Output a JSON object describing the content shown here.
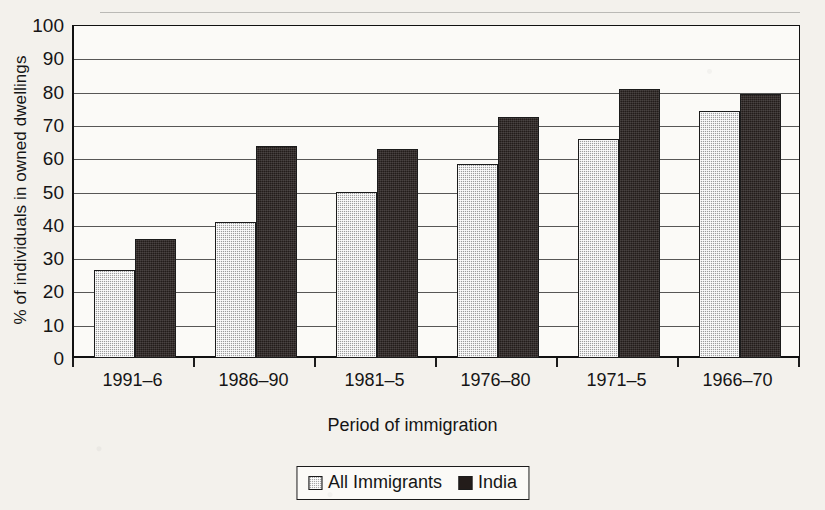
{
  "chart_data": {
    "type": "bar",
    "title": "",
    "xlabel": "Period of immigration",
    "ylabel": "% of individuals in owned dwellings",
    "categories": [
      "1991–6",
      "1986–90",
      "1981–5",
      "1976–80",
      "1971–5",
      "1966–70"
    ],
    "series": [
      {
        "name": "All Immigrants",
        "values": [
          26.5,
          41,
          50,
          58.5,
          66,
          74.5
        ],
        "color": "#9c9c9c",
        "pattern": "light-hatch"
      },
      {
        "name": "India",
        "values": [
          36,
          64,
          63,
          72.5,
          81,
          79.5
        ],
        "color": "#231c1a",
        "pattern": "solid-dark"
      }
    ],
    "ylim": [
      0,
      100
    ],
    "ytick_labels": [
      "100",
      "90",
      "80",
      "70",
      "60",
      "50",
      "40",
      "30",
      "20",
      "10",
      "0"
    ],
    "ytick_values": [
      100,
      90,
      80,
      70,
      60,
      50,
      40,
      30,
      20,
      10,
      0
    ],
    "grid": true,
    "grid_axis": "y",
    "legend_position": "bottom-center"
  },
  "axes": {
    "y_title": "% of individuals in owned dwellings",
    "x_title": "Period of immigration"
  },
  "legend": {
    "items": [
      {
        "label": "All Immigrants",
        "swatch": "light-hatch-swatch"
      },
      {
        "label": "India",
        "swatch": "dark-swatch"
      }
    ]
  },
  "page": {
    "title_sliver": "",
    "background": "#f3f1ec",
    "ink": "#151515"
  }
}
